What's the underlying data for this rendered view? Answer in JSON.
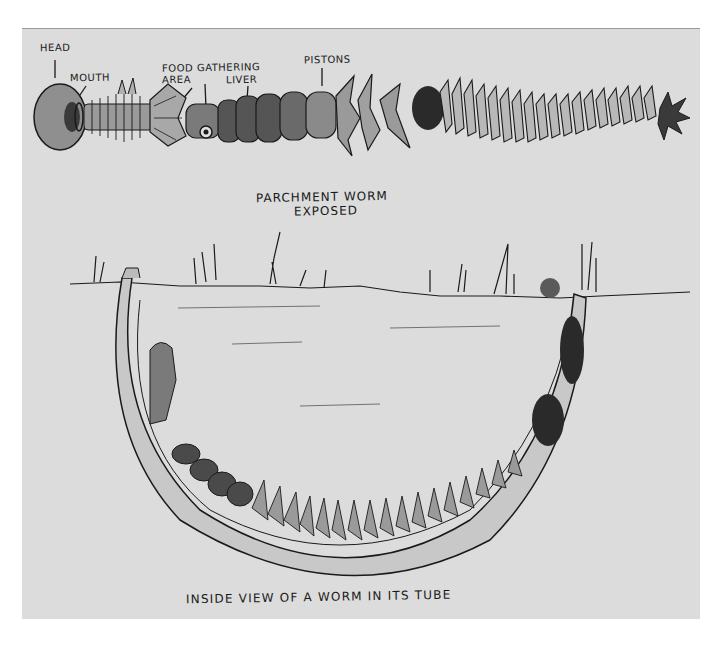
{
  "illustration": {
    "type": "hand-drawn scientific sketch",
    "subject": "parchment worm",
    "colors": {
      "paper": "#dcdcdc",
      "ink": "#1a1a1a",
      "shade": "#4a4a4a",
      "page": "#ffffff"
    }
  },
  "labels": {
    "head": "HEAD",
    "mouth": "MOUTH",
    "food_gathering_1": "FOOD GATHERING",
    "food_gathering_2": "AREA",
    "liver": "LIVER",
    "pistons": "PISTONS"
  },
  "title": {
    "line1": "PARCHMENT  WORM",
    "line2": "EXPOSED"
  },
  "caption": "INSIDE VIEW OF A WORM IN ITS TUBE"
}
